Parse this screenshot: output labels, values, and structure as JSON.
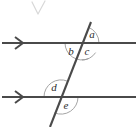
{
  "diagram": {
    "background_color": "#ffffff",
    "line_color": "#4a4a4a",
    "arc_color": "#9a9a9a",
    "label_color": "#2b2b2b",
    "parallel_lines": [
      {
        "name": "upper-parallel-line",
        "y": 43,
        "x_start": 2,
        "x_end": 136,
        "arrow_marker": "right-arrowhead",
        "arrow_x": 22
      },
      {
        "name": "lower-parallel-line",
        "y": 97,
        "x_start": 2,
        "x_end": 136,
        "arrow_marker": "right-arrowhead",
        "arrow_x": 22
      }
    ],
    "transversal": {
      "name": "transversal-line",
      "x_top": 91,
      "y_top": 22,
      "x_bottom": 50,
      "y_bottom": 127
    },
    "intersections": [
      {
        "name": "upper-intersection",
        "x": 82,
        "y": 43
      },
      {
        "name": "lower-intersection",
        "x": 61,
        "y": 97
      }
    ],
    "angle_labels": [
      {
        "id": "a",
        "text": "a",
        "x": 92,
        "y": 35,
        "at": "upper-intersection",
        "position": "upper-right"
      },
      {
        "id": "b",
        "text": "b",
        "x": 71,
        "y": 52,
        "at": "upper-intersection",
        "position": "lower-left"
      },
      {
        "id": "c",
        "text": "c",
        "x": 87,
        "y": 52,
        "at": "upper-intersection",
        "position": "lower-right"
      },
      {
        "id": "d",
        "text": "d",
        "x": 54,
        "y": 88,
        "at": "lower-intersection",
        "position": "upper-left"
      },
      {
        "id": "e",
        "text": "e",
        "x": 66,
        "y": 106,
        "at": "lower-intersection",
        "position": "lower-right"
      }
    ]
  }
}
